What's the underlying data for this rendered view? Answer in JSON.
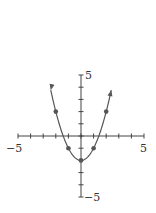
{
  "chart_data": {
    "type": "line",
    "title": "",
    "function": "y = x^2 - 2",
    "xlabel": "",
    "ylabel": "",
    "xlim": [
      -5,
      5
    ],
    "ylim": [
      -5,
      5
    ],
    "x_tick_labels": [
      "-5",
      "5"
    ],
    "y_tick_labels": [
      "5",
      "-5"
    ],
    "x_ticks": [
      -5,
      -4,
      -3,
      -2,
      -1,
      0,
      1,
      2,
      3,
      4,
      5
    ],
    "y_ticks": [
      -5,
      -4,
      -3,
      -2,
      -1,
      0,
      1,
      2,
      3,
      4,
      5
    ],
    "grid": false,
    "curve_domain": [
      -2.4,
      2.4
    ],
    "curve_arrows": true,
    "series": [
      {
        "name": "y = x^2 - 2",
        "points": [
          {
            "x": -2,
            "y": 2
          },
          {
            "x": -1,
            "y": -1
          },
          {
            "x": 0,
            "y": -2
          },
          {
            "x": 1,
            "y": -1
          },
          {
            "x": 2,
            "y": 2
          }
        ]
      }
    ],
    "colors": {
      "axis": "#444444",
      "curve": "#555555",
      "points": "#555555"
    }
  },
  "labels": {
    "x_min": "−5",
    "x_max": "5",
    "y_max": "5",
    "y_min": "−5"
  }
}
